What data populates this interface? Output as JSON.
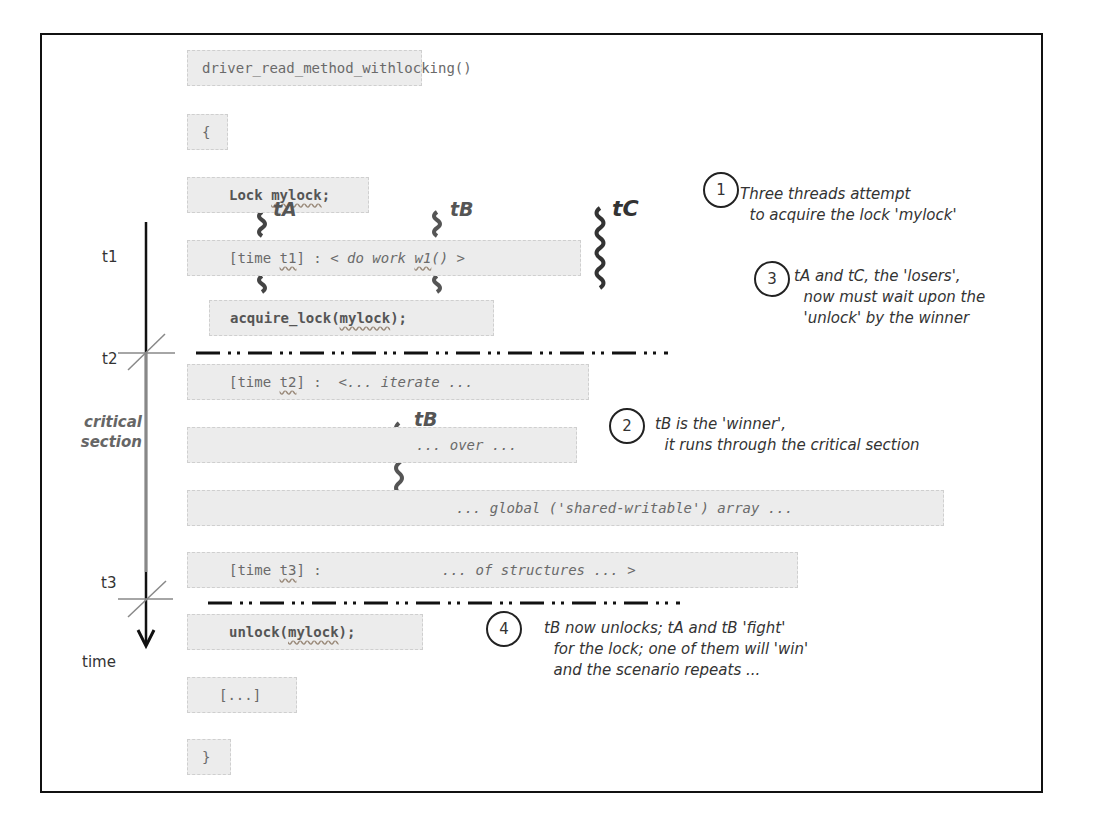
{
  "code_lines": {
    "func_sig": "driver_read_method_withlocking()",
    "open_brace": "{",
    "lock_decl_kw": "Lock ",
    "lock_decl_var": "mylock",
    "lock_decl_end": ";",
    "t1_prefix": "[time ",
    "t1_name": "t1",
    "t1_mid": "] : ",
    "t1_work_a": "< do work ",
    "t1_work_fn": "w1",
    "t1_work_b": "() >",
    "acquire_a": "acquire_lock(",
    "acquire_var": "mylock",
    "acquire_b": ");",
    "t2_prefix": "[time ",
    "t2_name": "t2",
    "t2_mid": "] :  ",
    "t2_text": "<... iterate ...",
    "over_text": "... over ...",
    "global_text": "... global ('shared-writable') array ...",
    "t3_prefix": "[time ",
    "t3_name": "t3",
    "t3_mid": "] :",
    "t3_text": "... of structures ... >",
    "unlock_a": "unlock(",
    "unlock_var": "mylock",
    "unlock_b": ");",
    "ellipsis": "[...]",
    "close_brace": "}"
  },
  "threads": {
    "tA": "tA",
    "tB": "tB",
    "tC": "tC",
    "tB_inner": "tB"
  },
  "timeline": {
    "t1": "t1",
    "t2": "t2",
    "t3": "t3",
    "axis_label": "time",
    "critical_line1": "critical",
    "critical_line2": "section"
  },
  "annotations": [
    {
      "number": "1",
      "text": "Three threads attempt\n  to acquire the lock 'mylock'"
    },
    {
      "number": "2",
      "text": "tB is the 'winner',\n  it runs through the critical section"
    },
    {
      "number": "3",
      "text": "tA and tC, the 'losers',\n  now must wait upon the\n  'unlock' by the winner"
    },
    {
      "number": "4",
      "text": "tB now unlocks; tA and tB 'fight'\n  for the lock; one of them will 'win'\n  and the scenario repeats ..."
    }
  ],
  "colors": {
    "code_bg": "#ececec",
    "code_text": "#6a6a6a",
    "frame": "#111111",
    "thread_squiggle": "#444444"
  }
}
